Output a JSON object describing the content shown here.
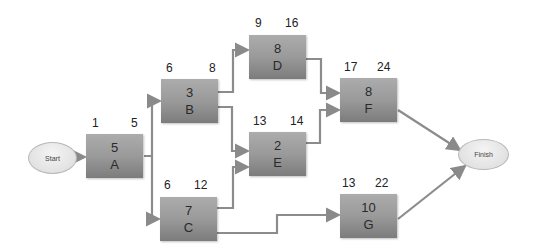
{
  "diagram": {
    "type": "activity-on-node network",
    "start": {
      "label": "Start"
    },
    "finish": {
      "label": "Finish"
    },
    "activities": [
      {
        "id": "A",
        "duration": "5",
        "es": "1",
        "ef": "5"
      },
      {
        "id": "B",
        "duration": "3",
        "es": "6",
        "ef": "8"
      },
      {
        "id": "C",
        "duration": "7",
        "es": "6",
        "ef": "12"
      },
      {
        "id": "D",
        "duration": "8",
        "es": "9",
        "ef": "16"
      },
      {
        "id": "E",
        "duration": "2",
        "es": "13",
        "ef": "14"
      },
      {
        "id": "F",
        "duration": "8",
        "es": "17",
        "ef": "24"
      },
      {
        "id": "G",
        "duration": "10",
        "es": "13",
        "ef": "22"
      }
    ],
    "edges": [
      [
        "Start",
        "A"
      ],
      [
        "A",
        "B"
      ],
      [
        "A",
        "C"
      ],
      [
        "B",
        "D"
      ],
      [
        "B",
        "E"
      ],
      [
        "C",
        "E"
      ],
      [
        "C",
        "G"
      ],
      [
        "D",
        "F"
      ],
      [
        "E",
        "F"
      ],
      [
        "F",
        "Finish"
      ],
      [
        "G",
        "Finish"
      ]
    ]
  }
}
